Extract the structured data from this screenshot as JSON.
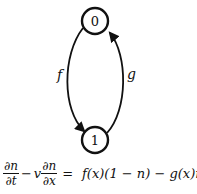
{
  "diagram": {
    "nodes": [
      {
        "id": "0",
        "label": "0",
        "cx": 95,
        "cy": 21,
        "r": 13
      },
      {
        "id": "1",
        "label": "1",
        "cx": 95,
        "cy": 140,
        "r": 13
      }
    ],
    "edges": [
      {
        "from": "0",
        "to": "1",
        "label": "f",
        "side": "left"
      },
      {
        "from": "1",
        "to": "0",
        "label": "g",
        "side": "right"
      }
    ]
  },
  "equation": {
    "term1_num": "∂n",
    "term1_den": "∂t",
    "minus1": "−",
    "v": "v",
    "term2_num": "∂n",
    "term2_den": "∂x",
    "equals": "=",
    "rhs": "f(x)(1 − n) − g(x)n"
  }
}
